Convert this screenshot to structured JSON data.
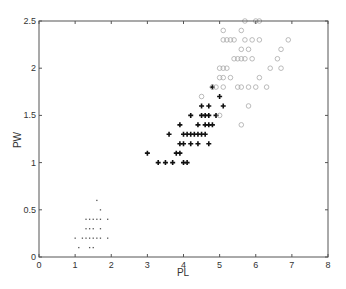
{
  "chart_data": {
    "type": "scatter",
    "title": "",
    "xlabel": "PL",
    "ylabel": "PW",
    "xlim": [
      0,
      8
    ],
    "ylim": [
      0,
      2.5
    ],
    "xticks": [
      "0",
      "1",
      "2",
      "3",
      "4",
      "5",
      "6",
      "7",
      "8"
    ],
    "yticks": [
      "0",
      "0.5",
      "1",
      "1.5",
      "2",
      "2.5"
    ],
    "grid": false,
    "legend": null,
    "series": [
      {
        "name": "setosa",
        "marker": "dot",
        "color": "#555555",
        "points": [
          [
            1.0,
            0.2
          ],
          [
            1.1,
            0.1
          ],
          [
            1.2,
            0.2
          ],
          [
            1.3,
            0.2
          ],
          [
            1.3,
            0.3
          ],
          [
            1.3,
            0.4
          ],
          [
            1.4,
            0.1
          ],
          [
            1.4,
            0.2
          ],
          [
            1.4,
            0.3
          ],
          [
            1.4,
            0.4
          ],
          [
            1.5,
            0.1
          ],
          [
            1.5,
            0.2
          ],
          [
            1.5,
            0.3
          ],
          [
            1.5,
            0.4
          ],
          [
            1.6,
            0.2
          ],
          [
            1.6,
            0.4
          ],
          [
            1.6,
            0.6
          ],
          [
            1.7,
            0.2
          ],
          [
            1.7,
            0.3
          ],
          [
            1.7,
            0.4
          ],
          [
            1.7,
            0.5
          ],
          [
            1.9,
            0.2
          ],
          [
            1.9,
            0.4
          ]
        ]
      },
      {
        "name": "versicolor",
        "marker": "plus",
        "color": "#111111",
        "points": [
          [
            3.0,
            1.1
          ],
          [
            3.3,
            1.0
          ],
          [
            3.5,
            1.0
          ],
          [
            3.6,
            1.3
          ],
          [
            3.7,
            1.0
          ],
          [
            3.8,
            1.1
          ],
          [
            3.9,
            1.1
          ],
          [
            3.9,
            1.2
          ],
          [
            3.9,
            1.4
          ],
          [
            4.0,
            1.0
          ],
          [
            4.0,
            1.2
          ],
          [
            4.0,
            1.3
          ],
          [
            4.1,
            1.0
          ],
          [
            4.1,
            1.3
          ],
          [
            4.2,
            1.2
          ],
          [
            4.2,
            1.3
          ],
          [
            4.2,
            1.5
          ],
          [
            4.3,
            1.3
          ],
          [
            4.4,
            1.2
          ],
          [
            4.4,
            1.3
          ],
          [
            4.4,
            1.4
          ],
          [
            4.5,
            1.3
          ],
          [
            4.5,
            1.5
          ],
          [
            4.5,
            1.6
          ],
          [
            4.6,
            1.3
          ],
          [
            4.6,
            1.4
          ],
          [
            4.6,
            1.5
          ],
          [
            4.7,
            1.2
          ],
          [
            4.7,
            1.4
          ],
          [
            4.7,
            1.5
          ],
          [
            4.7,
            1.6
          ],
          [
            4.8,
            1.4
          ],
          [
            4.8,
            1.8
          ],
          [
            4.9,
            1.5
          ],
          [
            5.0,
            1.7
          ],
          [
            5.1,
            1.6
          ]
        ]
      },
      {
        "name": "virginica",
        "marker": "circle",
        "color": "#aaaaaa",
        "points": [
          [
            4.5,
            1.7
          ],
          [
            4.8,
            1.8
          ],
          [
            4.9,
            1.8
          ],
          [
            5.0,
            1.5
          ],
          [
            5.0,
            2.0
          ],
          [
            5.0,
            1.9
          ],
          [
            5.1,
            1.8
          ],
          [
            5.1,
            1.9
          ],
          [
            5.1,
            2.0
          ],
          [
            5.1,
            2.3
          ],
          [
            5.1,
            2.4
          ],
          [
            5.2,
            2.0
          ],
          [
            5.2,
            2.3
          ],
          [
            5.3,
            1.9
          ],
          [
            5.3,
            2.3
          ],
          [
            5.4,
            2.1
          ],
          [
            5.4,
            2.3
          ],
          [
            5.5,
            1.8
          ],
          [
            5.5,
            2.1
          ],
          [
            5.6,
            1.4
          ],
          [
            5.6,
            1.8
          ],
          [
            5.6,
            2.1
          ],
          [
            5.6,
            2.2
          ],
          [
            5.6,
            2.4
          ],
          [
            5.7,
            2.1
          ],
          [
            5.7,
            2.3
          ],
          [
            5.7,
            2.5
          ],
          [
            5.8,
            1.6
          ],
          [
            5.8,
            1.8
          ],
          [
            5.8,
            2.2
          ],
          [
            5.9,
            2.1
          ],
          [
            5.9,
            2.3
          ],
          [
            6.0,
            1.8
          ],
          [
            6.0,
            2.5
          ],
          [
            6.1,
            1.9
          ],
          [
            6.1,
            2.3
          ],
          [
            6.1,
            2.5
          ],
          [
            6.3,
            1.8
          ],
          [
            6.6,
            2.1
          ],
          [
            6.7,
            2.0
          ],
          [
            6.7,
            2.2
          ],
          [
            6.9,
            2.3
          ],
          [
            6.4,
            2.0
          ]
        ]
      }
    ]
  }
}
